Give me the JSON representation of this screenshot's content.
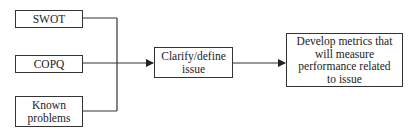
{
  "diagram": {
    "inputs": [
      {
        "label": "SWOT"
      },
      {
        "label": "COPQ"
      },
      {
        "label": "Known problems"
      }
    ],
    "middle": {
      "label": "Clarify/define issue"
    },
    "output": {
      "label": "Develop metrics that will measure performance related to issue"
    },
    "colors": {
      "line": "#333333",
      "text": "#222222",
      "background": "#ffffff"
    }
  }
}
